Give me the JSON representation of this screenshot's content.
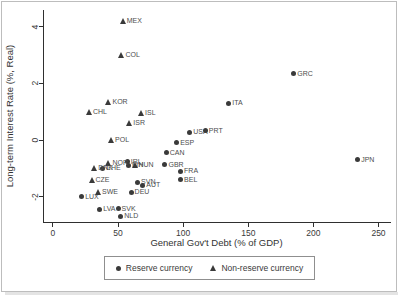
{
  "figure": {
    "x_axis_label": "General Gov't Debt (% of GDP)",
    "y_axis_label": "Long-term Interest Rate (%, Real)",
    "legend": {
      "reserve_label": "Reserve currency",
      "non_reserve_label": "Non-reserve currency"
    },
    "colors": {
      "marker": "#3a3a3a",
      "point_label_text": "#4d4d4d",
      "axis": "#2f2f2f",
      "figure_border": "#bdbdbd",
      "legend_border": "#8f8f8f"
    }
  },
  "chart_data": {
    "type": "scatter",
    "title": "",
    "xlabel": "General Gov't Debt (% of GDP)",
    "ylabel": "Long-term Interest Rate (%, Real)",
    "xlim": [
      -6.9,
      259.6
    ],
    "ylim": [
      -2.9,
      4.6
    ],
    "x_ticks": [
      0,
      50,
      100,
      150,
      200,
      250
    ],
    "y_ticks": [
      -2,
      0,
      2,
      4
    ],
    "grid": false,
    "legend_position": "bottom-center",
    "series": [
      {
        "name": "Reserve currency",
        "marker": "circle",
        "points": [
          {
            "label": "USA",
            "x": 105,
            "y": 0.27
          },
          {
            "label": "PRT",
            "x": 117,
            "y": 0.32
          },
          {
            "label": "GRC",
            "x": 185,
            "y": 2.35
          },
          {
            "label": "ITA",
            "x": 135,
            "y": 1.3
          },
          {
            "label": "ESP",
            "x": 95,
            "y": -0.1
          },
          {
            "label": "CAN",
            "x": 87,
            "y": -0.45
          },
          {
            "label": "GBR",
            "x": 86,
            "y": -0.88
          },
          {
            "label": "IRL",
            "x": 57,
            "y": -0.77
          },
          {
            "label": "FIN",
            "x": 58,
            "y": -0.9
          },
          {
            "label": "FRA",
            "x": 98,
            "y": -1.1
          },
          {
            "label": "BEL",
            "x": 98,
            "y": -1.4
          },
          {
            "label": "SVN",
            "x": 65,
            "y": -1.5
          },
          {
            "label": "AUT",
            "x": 69,
            "y": -1.6
          },
          {
            "label": "DEU",
            "x": 60,
            "y": -1.85
          },
          {
            "label": "CHE",
            "x": 38,
            "y": -1.0
          },
          {
            "label": "LUX",
            "x": 22,
            "y": -2.0
          },
          {
            "label": "LVA",
            "x": 36,
            "y": -2.45
          },
          {
            "label": "SVK",
            "x": 50,
            "y": -2.43
          },
          {
            "label": "NLD",
            "x": 52,
            "y": -2.7
          },
          {
            "label": "JPN",
            "x": 234,
            "y": -0.7
          }
        ]
      },
      {
        "name": "Non-reserve currency",
        "marker": "triangle",
        "points": [
          {
            "label": "MEX",
            "x": 54,
            "y": 4.2
          },
          {
            "label": "COL",
            "x": 53,
            "y": 3.0
          },
          {
            "label": "KOR",
            "x": 43,
            "y": 1.35
          },
          {
            "label": "CHL",
            "x": 28,
            "y": 1.0
          },
          {
            "label": "ISL",
            "x": 68,
            "y": 0.95
          },
          {
            "label": "ISR",
            "x": 59,
            "y": 0.6
          },
          {
            "label": "POL",
            "x": 45,
            "y": 0.0
          },
          {
            "label": "NOR",
            "x": 43,
            "y": -0.8
          },
          {
            "label": "DNK",
            "x": 32,
            "y": -1.0
          },
          {
            "label": "HUN",
            "x": 63,
            "y": -0.9
          },
          {
            "label": "CZE",
            "x": 30,
            "y": -1.4
          },
          {
            "label": "SWE",
            "x": 35,
            "y": -1.85
          }
        ]
      }
    ]
  }
}
